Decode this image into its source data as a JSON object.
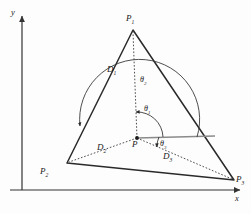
{
  "figure": {
    "background_color": "#fdfdfd",
    "line_color": "#2a2a2a",
    "axis_color": "#333333",
    "ray_color": "#8a8a8a"
  },
  "axes": {
    "x_label": "x",
    "y_label": "y",
    "origin": {
      "x": 22,
      "y": 190
    }
  },
  "vertices": [
    {
      "id": "P1",
      "label": "P",
      "sub": "1",
      "x": 133,
      "y": 30,
      "label_x": 126,
      "label_y": 14
    },
    {
      "id": "P2",
      "label": "P",
      "sub": "2",
      "x": 67,
      "y": 163,
      "label_x": 40,
      "label_y": 167
    },
    {
      "id": "P3",
      "label": "P",
      "sub": "3",
      "x": 234,
      "y": 180,
      "label_x": 236,
      "label_y": 175
    },
    {
      "id": "P",
      "label": "P",
      "sub": "",
      "x": 137,
      "y": 138,
      "label_x": 132,
      "label_y": 140
    }
  ],
  "distances": [
    {
      "id": "D1",
      "label": "D",
      "sub": "1",
      "from": "P",
      "to": "P1",
      "label_x": 107,
      "label_y": 65
    },
    {
      "id": "D2",
      "label": "D",
      "sub": "2",
      "from": "P",
      "to": "P2",
      "label_x": 97,
      "label_y": 143
    },
    {
      "id": "D3",
      "label": "D",
      "sub": "3",
      "from": "P",
      "to": "P3",
      "label_x": 163,
      "label_y": 152
    }
  ],
  "angles": [
    {
      "id": "theta1",
      "label": "θ",
      "sub": "1",
      "to": "D1",
      "arc_radius": 26,
      "label_x": 144,
      "label_y": 105
    },
    {
      "id": "theta2",
      "label": "θ",
      "sub": "2",
      "to": "D2",
      "arc_radius": 60,
      "label_x": 140,
      "label_y": 76
    },
    {
      "id": "theta3",
      "label": "θ",
      "sub": "3",
      "to": "D3",
      "arc_radius": 22,
      "label_x": 160,
      "label_y": 140
    }
  ],
  "reference_ray": {
    "name": "horizontal-reference-ray",
    "from_x": 137,
    "from_y": 138,
    "to_x": 215,
    "to_y": 136
  }
}
